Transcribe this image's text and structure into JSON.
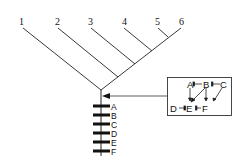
{
  "tree": {
    "tips": [
      {
        "label": "1",
        "x": 21,
        "y": 24
      },
      {
        "label": "2",
        "x": 58,
        "y": 24
      },
      {
        "label": "3",
        "x": 91,
        "y": 24
      },
      {
        "label": "4",
        "x": 124,
        "y": 24
      },
      {
        "label": "5",
        "x": 158,
        "y": 24
      },
      {
        "label": "6",
        "x": 181,
        "y": 24
      }
    ]
  },
  "chromosome": {
    "loci": [
      "A",
      "B",
      "C",
      "D",
      "E",
      "F"
    ]
  },
  "network_box": {
    "nodes": {
      "A": "A",
      "B": "B",
      "C": "C",
      "D": "D",
      "E": "E",
      "F": "F"
    }
  }
}
